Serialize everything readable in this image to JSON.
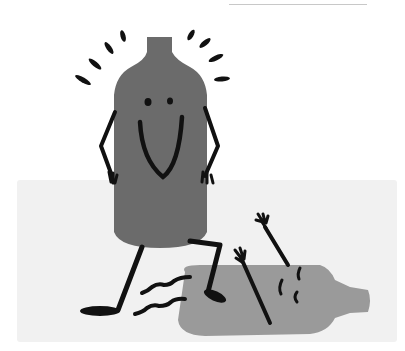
{
  "illustration": {
    "subject": "Cartoon of a standing smiling bottle stepping over a fallen bottle",
    "colors": {
      "standing_bottle": "#6b6b6b",
      "fallen_bottle": "#9a9a9a",
      "ink": "#111111",
      "floor": "#f1f1f1",
      "background": "#ffffff",
      "rule": "#c8c8c8"
    },
    "characters": [
      {
        "name": "standing-bottle",
        "expression": "smiling",
        "pose": "hands on hips, stepping"
      },
      {
        "name": "fallen-bottle",
        "expression": "dazed",
        "pose": "lying on side, arms raised"
      }
    ]
  }
}
